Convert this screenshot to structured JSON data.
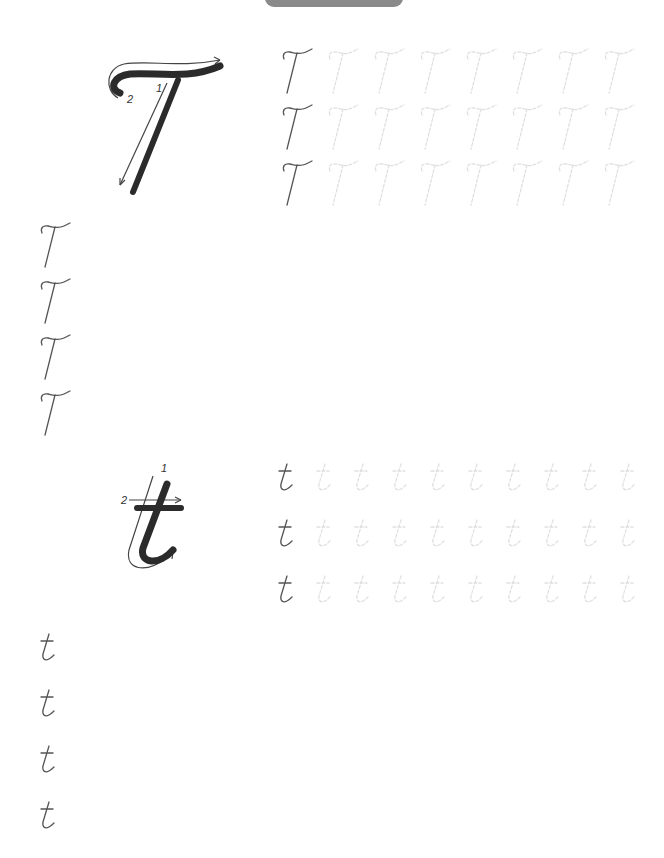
{
  "header": {
    "tab_color": "#8a8a8a"
  },
  "sections": [
    {
      "letter": "T",
      "case": "uppercase",
      "model": {
        "stroke_order": [
          "1",
          "2"
        ],
        "stroke_color": "#2b2b2b",
        "guide_color": "#444444"
      },
      "trace_rows": [
        {
          "example": "T",
          "trace_count": 8
        },
        {
          "example": "T",
          "trace_count": 8
        },
        {
          "example": "T",
          "trace_count": 8
        }
      ],
      "practice_rows": [
        {
          "example": "T"
        },
        {
          "example": "T"
        },
        {
          "example": "T"
        },
        {
          "example": "T"
        }
      ]
    },
    {
      "letter": "t",
      "case": "lowercase",
      "model": {
        "stroke_order": [
          "1",
          "2"
        ],
        "stroke_color": "#2b2b2b",
        "guide_color": "#444444"
      },
      "trace_rows": [
        {
          "example": "t",
          "trace_count": 9
        },
        {
          "example": "t",
          "trace_count": 9
        },
        {
          "example": "t",
          "trace_count": 9
        }
      ],
      "practice_rows": [
        {
          "example": "t"
        },
        {
          "example": "t"
        },
        {
          "example": "t"
        },
        {
          "example": "t"
        }
      ]
    }
  ],
  "colors": {
    "example_letter": "#555555",
    "trace_letter": "#e2e2e2"
  }
}
